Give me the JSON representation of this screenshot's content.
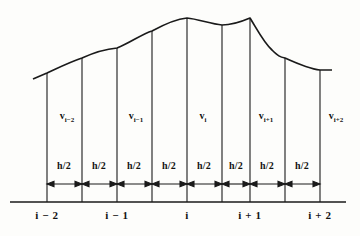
{
  "figure": {
    "kind": "finite-volume-grid-diagram",
    "stroke_color": "#1a1a1a",
    "background_color": "#fdfdfb",
    "baseline": {
      "y": 202,
      "x_start": 10,
      "x_end": 346
    },
    "cell_faces_x": [
      47,
      82,
      117,
      152,
      187,
      222,
      250,
      285,
      320
    ],
    "node_centers_x": [
      47,
      117,
      187,
      250,
      320
    ]
  },
  "curve": {
    "description": "profile curve across the grid",
    "points": [
      {
        "x": 33,
        "y": 79
      },
      {
        "x": 47,
        "y": 73
      },
      {
        "x": 82,
        "y": 58
      },
      {
        "x": 100,
        "y": 50
      },
      {
        "x": 117,
        "y": 48
      },
      {
        "x": 140,
        "y": 36
      },
      {
        "x": 163,
        "y": 25
      },
      {
        "x": 187,
        "y": 18
      },
      {
        "x": 205,
        "y": 22
      },
      {
        "x": 222,
        "y": 25
      },
      {
        "x": 238,
        "y": 22
      },
      {
        "x": 250,
        "y": 18
      },
      {
        "x": 268,
        "y": 40
      },
      {
        "x": 285,
        "y": 58
      },
      {
        "x": 300,
        "y": 66
      },
      {
        "x": 320,
        "y": 70
      },
      {
        "x": 332,
        "y": 70
      }
    ]
  },
  "cell_labels": [
    {
      "text": "v",
      "sub": "i−2",
      "x": 67,
      "y": 117
    },
    {
      "text": "v",
      "sub": "i−1",
      "x": 136,
      "y": 117
    },
    {
      "text": "v",
      "sub": "i",
      "x": 203,
      "y": 117
    },
    {
      "text": "v",
      "sub": "i+1",
      "x": 266,
      "y": 117
    },
    {
      "text": "v",
      "sub": "i+2",
      "x": 336,
      "y": 117
    }
  ],
  "spacing_labels": [
    {
      "text": "h/2",
      "x": 64,
      "y": 166
    },
    {
      "text": "h/2",
      "x": 99,
      "y": 166
    },
    {
      "text": "h/2",
      "x": 134,
      "y": 166
    },
    {
      "text": "h/2",
      "x": 169,
      "y": 166
    },
    {
      "text": "h/2",
      "x": 204,
      "y": 166
    },
    {
      "text": "h/2",
      "x": 236,
      "y": 166
    },
    {
      "text": "h/2",
      "x": 267,
      "y": 166
    },
    {
      "text": "h/2",
      "x": 302,
      "y": 166
    }
  ],
  "dimension_arrows": {
    "y": 184,
    "segments": [
      {
        "x1": 47,
        "x2": 82
      },
      {
        "x1": 82,
        "x2": 117
      },
      {
        "x1": 117,
        "x2": 152
      },
      {
        "x1": 152,
        "x2": 187
      },
      {
        "x1": 187,
        "x2": 222
      },
      {
        "x1": 222,
        "x2": 250
      },
      {
        "x1": 250,
        "x2": 285
      },
      {
        "x1": 285,
        "x2": 320
      }
    ]
  },
  "axis_labels": [
    {
      "text": "i − 2",
      "x": 47,
      "y": 213
    },
    {
      "text": "i − 1",
      "x": 117,
      "y": 213
    },
    {
      "text": "i",
      "x": 187,
      "y": 213
    },
    {
      "text": "i + 1",
      "x": 250,
      "y": 213
    },
    {
      "text": "i + 2",
      "x": 320,
      "y": 213
    }
  ]
}
